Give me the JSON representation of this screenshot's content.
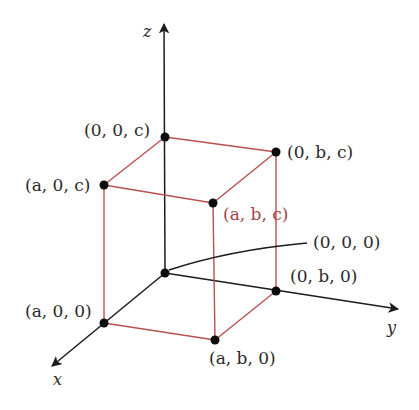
{
  "diagram": {
    "colors": {
      "axis": "#1c1c1c",
      "box_edge": "#b8504f",
      "highlight_label": "#a0454a",
      "point": "#0d0d0d",
      "background": "#ffffff"
    },
    "axes": {
      "x": {
        "label": "x"
      },
      "y": {
        "label": "y"
      },
      "z": {
        "label": "z"
      }
    },
    "points": {
      "origin": {
        "label": "(0, 0, 0)"
      },
      "a00": {
        "label": "(a, 0, 0)"
      },
      "ab0": {
        "label": "(a, b, 0)"
      },
      "0b0": {
        "label": "(0, b, 0)"
      },
      "00c": {
        "label": "(0, 0, c)"
      },
      "0bc": {
        "label": "(0, b, c)"
      },
      "a0c": {
        "label": "(a, 0, c)"
      },
      "abc": {
        "label": "(a, b, c)"
      }
    }
  }
}
